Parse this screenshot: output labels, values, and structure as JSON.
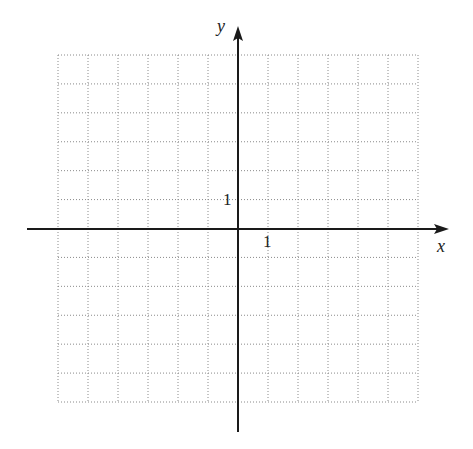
{
  "chart_data": {
    "type": "scatter",
    "title": "",
    "xlabel": "x",
    "ylabel": "y",
    "series": [],
    "xlim": [
      -6,
      6
    ],
    "ylim": [
      -6,
      6
    ],
    "grid": true,
    "grid_style": "dotted",
    "tick_labels": {
      "x": "1",
      "y": "1"
    },
    "legend": null
  },
  "labels": {
    "x_axis": "x",
    "y_axis": "y",
    "x_tick_one": "1",
    "y_tick_one": "1"
  },
  "colors": {
    "axis": "#1a1a1a",
    "grid": "#8a8a8a",
    "background": "#ffffff"
  }
}
